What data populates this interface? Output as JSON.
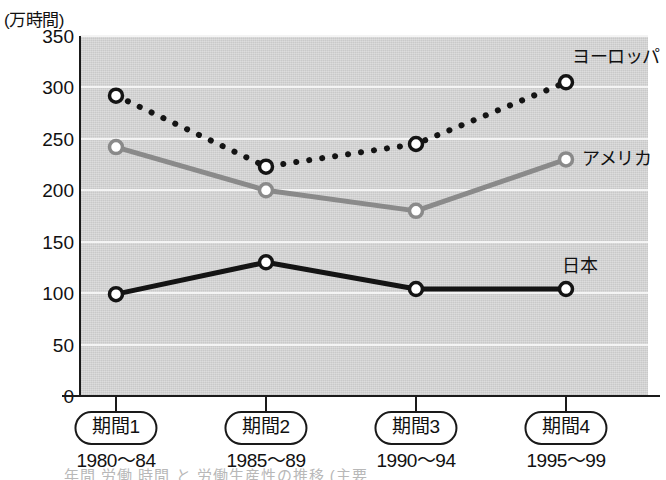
{
  "chart_data": {
    "type": "line",
    "title": "",
    "unit_label": "(万時間)",
    "ylabel": "",
    "xlabel": "",
    "ylim": [
      0,
      350
    ],
    "yticks": [
      0,
      50,
      100,
      150,
      200,
      250,
      300,
      350
    ],
    "grid": true,
    "legend_position": "line-end-labels",
    "categories": [
      "期間1",
      "期間2",
      "期間3",
      "期間4"
    ],
    "category_ranges": [
      "1980〜84",
      "1985〜89",
      "1990〜94",
      "1995〜99"
    ],
    "series": [
      {
        "name": "ヨーロッパ",
        "values": [
          292,
          223,
          245,
          305
        ],
        "color": "#141414",
        "style": "dotted",
        "marker": "open-circle"
      },
      {
        "name": "アメリカ",
        "values": [
          242,
          200,
          180,
          230
        ],
        "color": "#8a8a8a",
        "style": "solid",
        "marker": "open-circle"
      },
      {
        "name": "日本",
        "values": [
          99,
          130,
          104,
          104
        ],
        "color": "#141414",
        "style": "solid",
        "marker": "open-circle"
      }
    ]
  },
  "axis": {
    "unit_caption": "(万時間)",
    "y_tick_labels": [
      "350",
      "300",
      "250",
      "200",
      "150",
      "100",
      "50",
      "0"
    ]
  },
  "colors": {
    "plot_background": "#c9c9c9",
    "gridline": "#f4f4f4",
    "axis": "#1a1a1a",
    "europe": "#141414",
    "america": "#8a8a8a",
    "japan": "#141414"
  },
  "footnote": {
    "text": "年間 労働 時間           と       労働生産性の推移       (主要"
  }
}
